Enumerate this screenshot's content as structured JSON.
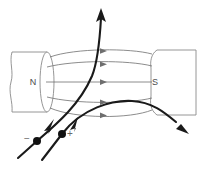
{
  "figure": {
    "title": "Charged particles deflected in a magnetic field between magnet poles",
    "width": 203,
    "height": 170,
    "background_color": "#ffffff"
  },
  "poles": {
    "north": {
      "label": "N",
      "label_x": 33,
      "label_y": 83,
      "shape": "cylinder-with-elliptical-face",
      "body_left": 10,
      "body_right": 47,
      "body_top": 52,
      "body_bottom": 112,
      "face_center_x": 47,
      "face_center_y": 82,
      "face_rx": 7,
      "face_ry": 30,
      "stroke_color": "#8a8a8a"
    },
    "south": {
      "label": "S",
      "label_x": 155,
      "label_y": 83,
      "shape": "rounded-rectangle",
      "left": 151,
      "right": 196,
      "top": 50,
      "bottom": 115,
      "corner_radius": 6,
      "stroke_color": "#8a8a8a"
    }
  },
  "field": {
    "direction": "north-to-south",
    "line_color": "#6e6e6e",
    "arrow_color": "#6e6e6e",
    "count": 5,
    "lines": [
      {
        "index": 0,
        "start_x": 50,
        "start_y": 57,
        "end_x": 152,
        "end_y": 54,
        "bulge_y": 51,
        "arrow_x": 104,
        "arrow_y": 51
      },
      {
        "index": 1,
        "start_x": 47,
        "start_y": 67,
        "end_x": 152,
        "end_y": 66,
        "bulge_y": 64,
        "arrow_x": 104,
        "arrow_y": 64
      },
      {
        "index": 2,
        "start_x": 46,
        "start_y": 82,
        "end_x": 152,
        "end_y": 82,
        "bulge_y": 82,
        "arrow_x": 104,
        "arrow_y": 82
      },
      {
        "index": 3,
        "start_x": 47,
        "start_y": 97,
        "end_x": 152,
        "end_y": 98,
        "bulge_y": 100,
        "arrow_x": 104,
        "arrow_y": 100
      },
      {
        "index": 4,
        "start_x": 50,
        "start_y": 108,
        "end_x": 152,
        "end_y": 110,
        "bulge_y": 114,
        "arrow_x": 104,
        "arrow_y": 114
      }
    ]
  },
  "trajectories": [
    {
      "name": "negative-particle-path",
      "charge_label": "−",
      "charge_label_x": 27,
      "charge_label_y": 139,
      "dot_x": 37,
      "dot_y": 141,
      "entry_x": 18,
      "entry_y": 158,
      "exit_x": 101,
      "exit_y": 10,
      "exit_arrow_direction": "up",
      "deflection": "upward",
      "midpoint_arrow_x": 47,
      "midpoint_arrow_y": 129,
      "color": "#1a1a1a"
    },
    {
      "name": "positive-particle-path",
      "charge_label": "+",
      "charge_label_x": 70,
      "charge_label_y": 134,
      "dot_x": 62,
      "dot_y": 134,
      "entry_x": 42,
      "entry_y": 160,
      "exit_x": 188,
      "exit_y": 133,
      "exit_arrow_direction": "down-right",
      "deflection": "downward-right",
      "midpoint_arrow_x": 72,
      "midpoint_arrow_y": 126,
      "color": "#1a1a1a"
    }
  ]
}
